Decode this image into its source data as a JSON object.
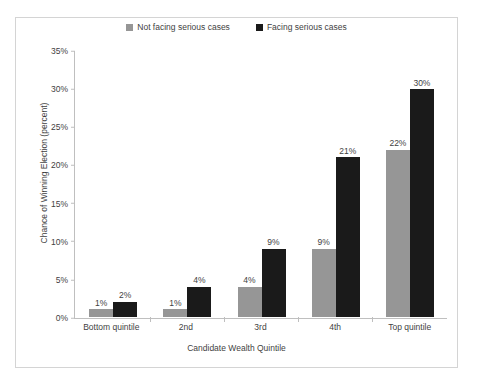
{
  "chart_data": {
    "type": "bar",
    "title": "",
    "xlabel": "Candidate Wealth Quintile",
    "ylabel": "Chance of Winning Election (percent)",
    "categories": [
      "Bottom quintile",
      "2nd",
      "3rd",
      "4th",
      "Top quintile"
    ],
    "series": [
      {
        "name": "Not facing serious cases",
        "color": "#969696",
        "values": [
          1,
          1,
          4,
          9,
          22
        ],
        "labels": [
          "1%",
          "1%",
          "4%",
          "9%",
          "22%"
        ]
      },
      {
        "name": "Facing serious cases",
        "color": "#1a1a1a",
        "values": [
          2,
          4,
          9,
          21,
          30
        ],
        "labels": [
          "2%",
          "4%",
          "9%",
          "21%",
          "30%"
        ]
      }
    ],
    "ylim": [
      0,
      35
    ],
    "ytick_values": [
      0,
      5,
      10,
      15,
      20,
      25,
      30,
      35
    ],
    "ytick_labels": [
      "0%",
      "5%",
      "10%",
      "15%",
      "20%",
      "25%",
      "30%",
      "35%"
    ],
    "grid": false,
    "legend_position": "top-center",
    "axis_color": "#bfbfbf",
    "border_color": "#d4d4d4",
    "text_color": "#3f3f3f",
    "background": "#ffffff"
  }
}
